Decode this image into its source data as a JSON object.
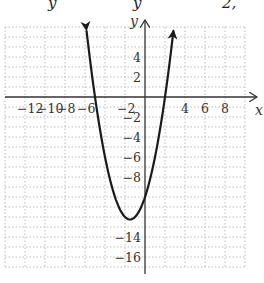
{
  "header": {
    "fragments": [
      "y",
      "y",
      "2,"
    ]
  },
  "colors": {
    "curve": "#1a1a1a",
    "axis": "#333333",
    "grid": "#bdbdbd",
    "text": "#333333"
  },
  "chart_data": {
    "type": "line",
    "title": "",
    "function": "y = x^2 + 3x - 10",
    "xlabel": "x",
    "ylabel": "y",
    "xlim": [
      -14,
      10
    ],
    "ylim": [
      -17,
      7
    ],
    "grid": true,
    "grid_step": 2,
    "x_tick_labels": [
      "-12",
      "-10",
      "-8",
      "-6",
      "-2",
      "4",
      "6",
      "8"
    ],
    "y_tick_labels": [
      "4",
      "2",
      "-2",
      "-4",
      "-6",
      "-8",
      "-14",
      "-16"
    ],
    "vertex": [
      -1.5,
      -12.25
    ],
    "x_intercepts": [
      -5,
      2
    ],
    "y_intercept": -10,
    "arrows_at_ends": true,
    "points": [
      [
        -5.8,
        3.24
      ],
      [
        -5.5,
        3.75
      ],
      [
        -5,
        0
      ],
      [
        -4.5,
        -3.25
      ],
      [
        -4,
        -6
      ],
      [
        -3.5,
        -8.25
      ],
      [
        -3,
        -10
      ],
      [
        -2.5,
        -11.25
      ],
      [
        -2,
        -12
      ],
      [
        -1.5,
        -12.25
      ],
      [
        -1,
        -12
      ],
      [
        -0.5,
        -11.25
      ],
      [
        0,
        -10
      ],
      [
        0.5,
        -8.25
      ],
      [
        1,
        -6
      ],
      [
        1.5,
        -3.25
      ],
      [
        2,
        0
      ],
      [
        2.5,
        3.75
      ],
      [
        2.8,
        6.24
      ]
    ]
  }
}
